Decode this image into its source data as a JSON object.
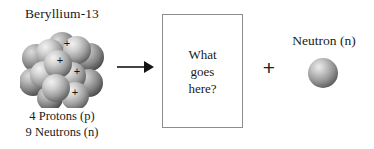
{
  "figure": {
    "background_color": "#ffffff",
    "text_color": "#1a1a1a",
    "box_border_color": "#8d8d8d"
  },
  "left_panel": {
    "title": "Beryllium-13",
    "nucleus": {
      "proton_label": "+",
      "proton_count": 4,
      "neutron_count": 9,
      "sphere_color_light": "#e8e8e8",
      "sphere_color_mid": "#a8a8a8",
      "sphere_color_dark": "#5f5f5f"
    },
    "legend": {
      "protons": "4 Protons (p)",
      "neutrons": "9 Neutrons (n)"
    }
  },
  "arrow": {
    "direction": "right",
    "color": "#141414"
  },
  "question_box": {
    "line1": "What",
    "line2": "goes",
    "line3": "here?"
  },
  "operator": {
    "symbol": "+"
  },
  "right_panel": {
    "title": "Neutron (n)",
    "particle": {
      "sphere_color_light": "#d8d8d8",
      "sphere_color_mid": "#9a9a9a",
      "sphere_color_dark": "#5a5a5a"
    }
  }
}
